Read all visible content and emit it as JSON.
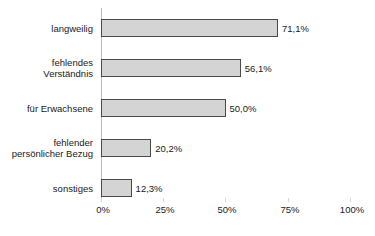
{
  "chart_data": {
    "type": "bar",
    "orientation": "horizontal",
    "title": "",
    "xlabel": "",
    "ylabel": "",
    "xlim": [
      0,
      100
    ],
    "grid": false,
    "legend": "none",
    "categories": [
      "langweilig",
      "fehlendes\nVerständnis",
      "für Erwachsene",
      "fehlender\npersönlicher Bezug",
      "sonstiges"
    ],
    "values": [
      71.1,
      56.1,
      50.0,
      20.2,
      12.3
    ],
    "value_labels": [
      "71,1%",
      "56,1%",
      "50,0%",
      "20,2%",
      "12,3%"
    ],
    "xticks": [
      0,
      25,
      50,
      75,
      100
    ],
    "xtick_labels": [
      "0%",
      "25%",
      "50%",
      "75%",
      "100%"
    ],
    "colors": {
      "bar_fill": "#d4d4d4",
      "bar_border": "#4a4a4a",
      "axis_line": "#b9b9b9",
      "text": "#1a1a1a",
      "background": "#ffffff"
    }
  }
}
